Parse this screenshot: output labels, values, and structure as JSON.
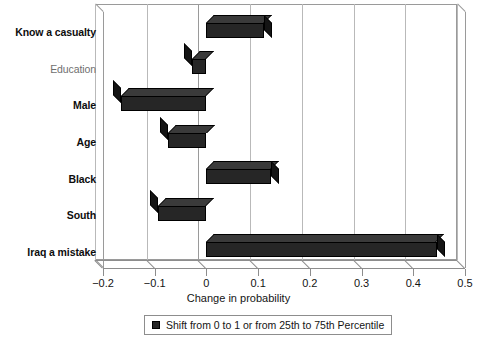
{
  "chart_data": {
    "type": "bar",
    "orientation": "horizontal",
    "title": "",
    "xlabel": "Change in probability",
    "ylabel": "",
    "xlim": [
      -0.2,
      0.5
    ],
    "xticks": [
      -0.2,
      -0.1,
      0,
      0.1,
      0.2,
      0.3,
      0.4,
      0.5
    ],
    "xtick_labels": [
      "−0.2",
      "−0.1",
      "0",
      "0.1",
      "0.2",
      "0.3",
      "0.4",
      "0.5"
    ],
    "grid": true,
    "grid_axis": "x",
    "categories": [
      "Know a casualty",
      "Education",
      "Male",
      "Age",
      "Black",
      "South",
      "Iraq a mistake"
    ],
    "values": [
      0.112,
      -0.028,
      -0.165,
      -0.075,
      0.125,
      -0.093,
      0.445
    ],
    "series": [
      {
        "name": "Shift from 0 to 1 or from 25th to 75th Percentile",
        "values": [
          0.112,
          -0.028,
          -0.165,
          -0.075,
          0.125,
          -0.093,
          0.445
        ],
        "color": "#262626"
      }
    ],
    "legend": {
      "position": "below",
      "entries": [
        {
          "label": "Shift from 0 to 1 or from 25th to 75th Percentile",
          "color": "#262626",
          "marker": "square"
        }
      ]
    },
    "label_styles": [
      "bold",
      "regular-muted",
      "bold",
      "bold",
      "bold",
      "bold",
      "bold"
    ]
  },
  "colors": {
    "bar_face": "#262626",
    "bar_top": "#3a3a3a",
    "bar_side": "#141414",
    "frame": "#9a9a9a",
    "grid": "#b9b9b9",
    "axis": "#8d8d8d",
    "text": "#141414",
    "text_muted": "#6f6f6f",
    "background": "#ffffff"
  }
}
